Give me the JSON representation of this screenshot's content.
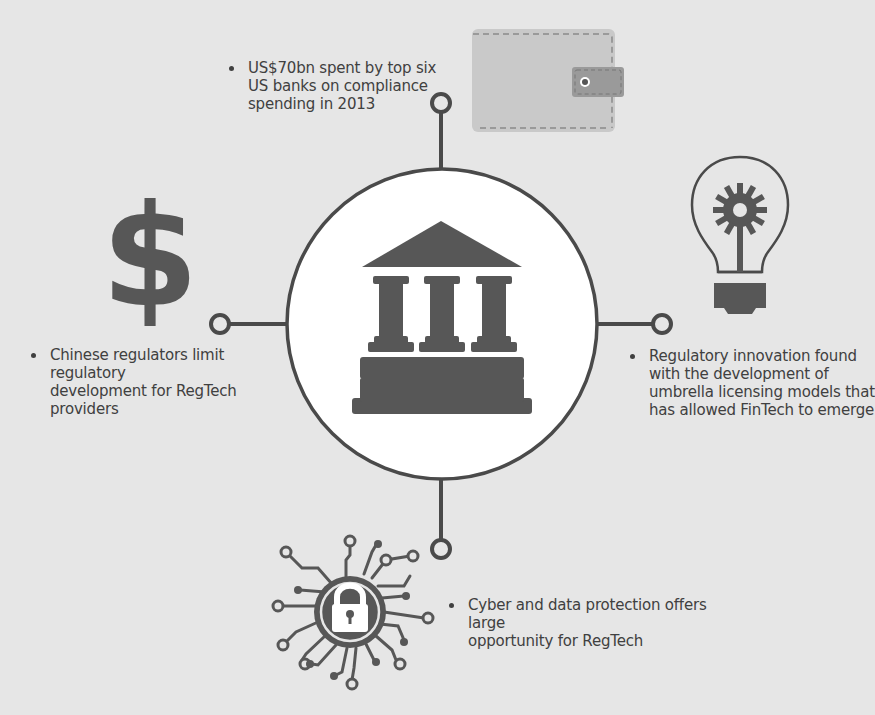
{
  "colors": {
    "background": "#e6e6e6",
    "icon_dark": "#575757",
    "line": "#4a4a4a",
    "circle_fill": "#ffffff",
    "wallet_body": "#c9c9c9",
    "wallet_strap": "#9a9a9a"
  },
  "center": {
    "icon": "bank-building-icon"
  },
  "nodes": [
    {
      "id": "top",
      "icon": "wallet-icon",
      "text": "US$70bn spent by top six\nUS banks on compliance\nspending in 2013"
    },
    {
      "id": "left",
      "icon": "dollar-sign-icon",
      "text": "Chinese regulators limit regulatory\ndevelopment for RegTech providers"
    },
    {
      "id": "right",
      "icon": "lightbulb-gear-icon",
      "text": "Regulatory innovation found\nwith the development of\numbrella licensing models that\nhas allowed FinTech to emerge"
    },
    {
      "id": "bottom",
      "icon": "circuit-padlock-icon",
      "text": "Cyber and data protection offers large\nopportunity for RegTech"
    }
  ]
}
